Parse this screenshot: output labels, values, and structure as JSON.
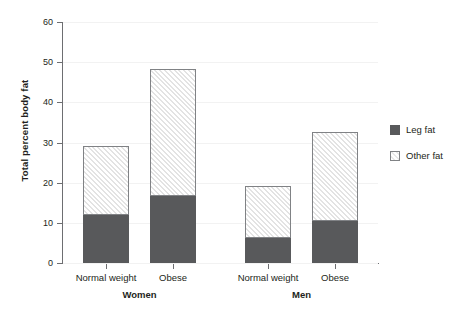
{
  "chart_data": {
    "type": "bar",
    "subtype": "stacked",
    "title": "",
    "xlabel": "",
    "ylabel": "Total percent body fat",
    "ylim": [
      0,
      60
    ],
    "yticks": [
      0,
      10,
      20,
      30,
      40,
      50,
      60
    ],
    "ytick_labels": [
      "0",
      "10",
      "20",
      "30",
      "40",
      "50",
      "60"
    ],
    "grid": true,
    "grid_axis": "y",
    "legend_position": "right",
    "categories": [
      "Normal weight",
      "Obese",
      "Normal weight",
      "Obese"
    ],
    "groups": [
      {
        "name": "Women",
        "categories": [
          "Normal weight",
          "Obese"
        ]
      },
      {
        "name": "Men",
        "categories": [
          "Normal weight",
          "Obese"
        ]
      }
    ],
    "series": [
      {
        "name": "Leg fat",
        "color": "#58595b",
        "fill": "solid",
        "values": [
          12.0,
          16.7,
          6.3,
          10.4
        ]
      },
      {
        "name": "Other fat",
        "color": "#ffffff",
        "fill": "diagonal-hatch",
        "values": [
          17.0,
          31.3,
          12.7,
          21.9
        ]
      }
    ],
    "totals": [
      29.0,
      48.0,
      19.0,
      32.3
    ]
  },
  "axis": {
    "y_title": "Total percent body fat"
  },
  "legend": {
    "items": [
      {
        "label": "Leg fat",
        "swatch": "solid-dark-square"
      },
      {
        "label": "Other fat",
        "swatch": "hatched-white-square"
      }
    ]
  }
}
